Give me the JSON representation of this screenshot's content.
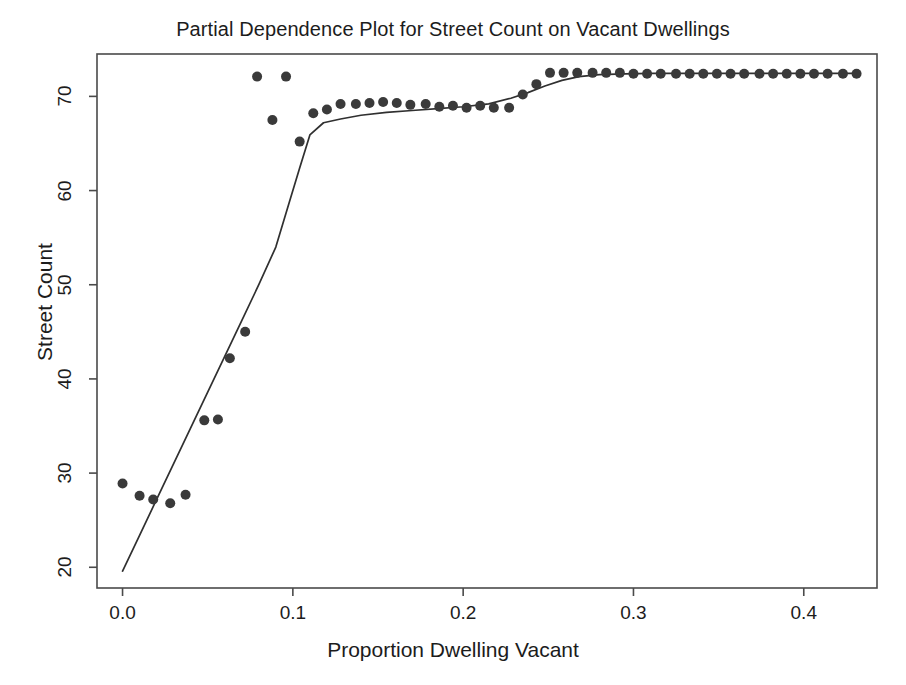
{
  "chart_data": {
    "type": "scatter",
    "title": "Partial Dependence Plot for Street Count on Vacant Dwellings",
    "xlabel": "Proportion Dwelling Vacant",
    "ylabel": "Street Count",
    "xlim": [
      -0.015,
      0.443
    ],
    "ylim": [
      17.8,
      74.5
    ],
    "xticks": [
      0.0,
      0.1,
      0.2,
      0.3,
      0.4
    ],
    "xtick_labels": [
      "0.0",
      "0.1",
      "0.2",
      "0.3",
      "0.4"
    ],
    "yticks": [
      20,
      30,
      40,
      50,
      60,
      70
    ],
    "ytick_labels": [
      "20",
      "30",
      "40",
      "50",
      "60",
      "70"
    ],
    "grid": false,
    "legend": false,
    "point_color": "#3a3a3a",
    "line_color": "#303030",
    "point_radius": 5.0,
    "series": [
      {
        "name": "Partial dependence points",
        "type": "scatter",
        "x": [
          0.0,
          0.01,
          0.018,
          0.028,
          0.037,
          0.048,
          0.056,
          0.063,
          0.072,
          0.079,
          0.088,
          0.096,
          0.104,
          0.112,
          0.12,
          0.128,
          0.137,
          0.145,
          0.153,
          0.161,
          0.169,
          0.178,
          0.186,
          0.194,
          0.202,
          0.21,
          0.218,
          0.227,
          0.235,
          0.243,
          0.251,
          0.259,
          0.267,
          0.276,
          0.284,
          0.292,
          0.3,
          0.308,
          0.316,
          0.325,
          0.333,
          0.341,
          0.349,
          0.357,
          0.365,
          0.374,
          0.382,
          0.39,
          0.398,
          0.406,
          0.414,
          0.423,
          0.431
        ],
        "y": [
          28.9,
          27.6,
          27.2,
          26.8,
          27.7,
          35.6,
          35.7,
          42.2,
          45.0,
          72.1,
          67.5,
          72.1,
          65.2,
          68.2,
          68.6,
          69.2,
          69.2,
          69.3,
          69.4,
          69.3,
          69.1,
          69.2,
          68.9,
          69.0,
          68.8,
          69.0,
          68.8,
          68.8,
          70.2,
          71.3,
          72.5,
          72.5,
          72.5,
          72.5,
          72.5,
          72.5,
          72.4,
          72.4,
          72.4,
          72.4,
          72.4,
          72.4,
          72.4,
          72.4,
          72.4,
          72.4,
          72.4,
          72.4,
          72.4,
          72.4,
          72.4,
          72.4,
          72.4
        ]
      },
      {
        "name": "Fitted partial dependence curve",
        "type": "line",
        "x": [
          0.0,
          0.01,
          0.02,
          0.03,
          0.04,
          0.05,
          0.06,
          0.07,
          0.08,
          0.09,
          0.098,
          0.104,
          0.11,
          0.118,
          0.128,
          0.14,
          0.155,
          0.17,
          0.185,
          0.2,
          0.215,
          0.228,
          0.238,
          0.248,
          0.258,
          0.268,
          0.28,
          0.295,
          0.31,
          0.33,
          0.36,
          0.4,
          0.431
        ],
        "y": [
          19.6,
          23.4,
          27.2,
          31.0,
          34.8,
          38.6,
          42.4,
          46.2,
          50.0,
          54.0,
          58.8,
          62.4,
          65.9,
          67.2,
          67.6,
          68.0,
          68.3,
          68.5,
          68.7,
          68.9,
          69.2,
          69.8,
          70.4,
          71.1,
          71.7,
          72.1,
          72.3,
          72.4,
          72.45,
          72.45,
          72.45,
          72.45,
          72.45
        ]
      }
    ]
  }
}
